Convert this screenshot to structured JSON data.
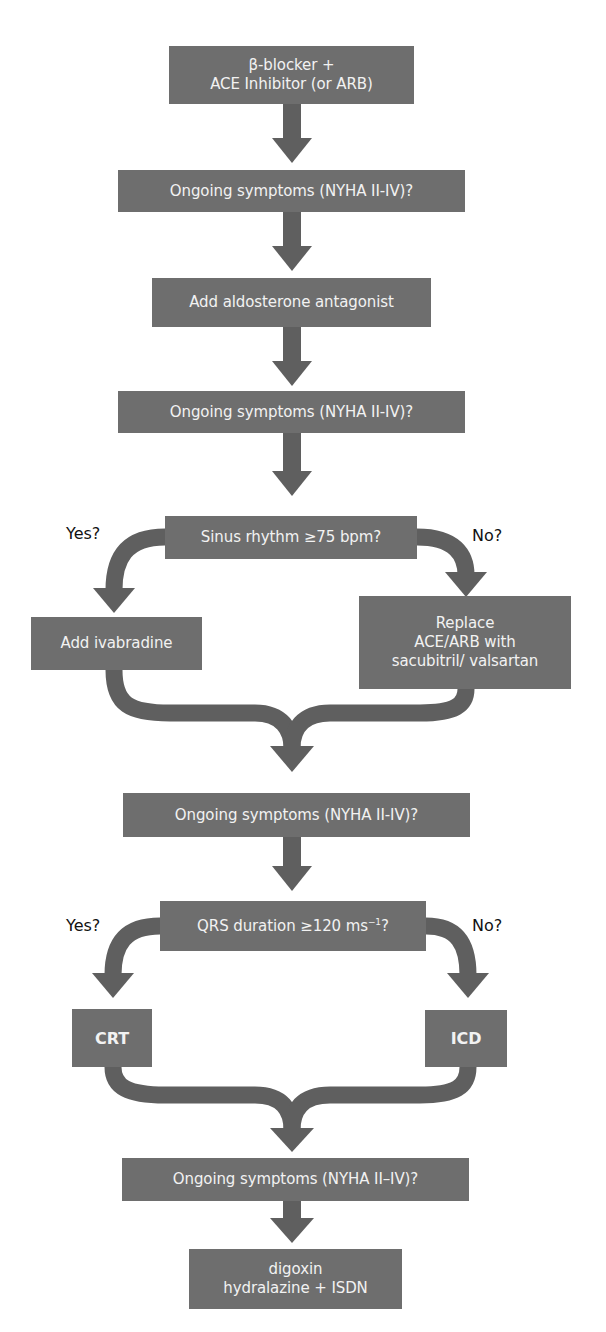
{
  "colors": {
    "node_fill": "#6e6e6e",
    "node_text": "#f2f2f2",
    "arrow": "#5f5f5f",
    "label_text": "#111111",
    "background": "#ffffff"
  },
  "nodes": {
    "start": {
      "line1": "β-blocker +",
      "line2": "ACE Inhibitor (or ARB)"
    },
    "ongoing1": {
      "text": "Ongoing symptoms (NYHA II-IV)?"
    },
    "aldosterone": {
      "text": "Add aldosterone antagonist"
    },
    "ongoing2": {
      "text": "Ongoing symptoms (NYHA II-IV)?"
    },
    "sinus": {
      "text": "Sinus rhythm ≥75 bpm?"
    },
    "ivabradine": {
      "text": "Add ivabradine"
    },
    "replace": {
      "line1": "Replace",
      "line2": "ACE/ARB with",
      "line3": "sacubitril/ valsartan"
    },
    "ongoing3": {
      "text": "Ongoing symptoms (NYHA II-IV)?"
    },
    "qrs": {
      "text": "QRS duration ≥120 ms",
      "sup": "−1",
      "suffix": "?"
    },
    "crt": {
      "text": "CRT"
    },
    "icd": {
      "text": "ICD"
    },
    "ongoing4": {
      "text": "Ongoing symptoms (NYHA II–IV)?"
    },
    "final": {
      "line1": "digoxin",
      "line2": "hydralazine + ISDN"
    }
  },
  "branch_labels": {
    "sinus_yes": "Yes?",
    "sinus_no": "No?",
    "qrs_yes": "Yes?",
    "qrs_no": "No?"
  }
}
